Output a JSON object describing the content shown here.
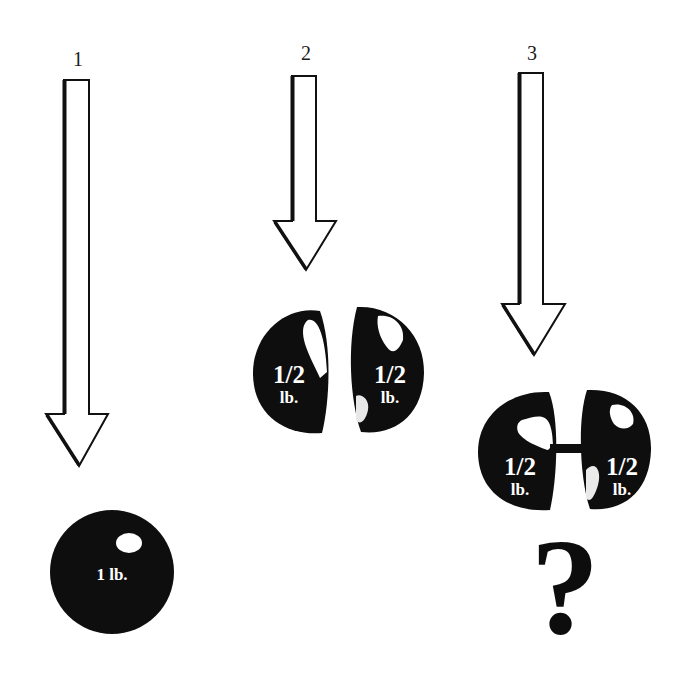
{
  "scenarios": [
    {
      "number": "1",
      "object": "whole-ball",
      "weight_label": "1 lb.",
      "arrow": "long-down-arrow"
    },
    {
      "number": "2",
      "object": "two-separate-halves",
      "halves": [
        {
          "fraction": "1/2",
          "unit": "lb."
        },
        {
          "fraction": "1/2",
          "unit": "lb."
        }
      ],
      "arrow": "short-down-arrow"
    },
    {
      "number": "3",
      "object": "two-connected-halves",
      "halves": [
        {
          "fraction": "1/2",
          "unit": "lb."
        },
        {
          "fraction": "1/2",
          "unit": "lb."
        }
      ],
      "arrow": "medium-down-arrow",
      "question": "?"
    }
  ],
  "colors": {
    "background": "#ffffff",
    "ink": "#111111",
    "highlight": "#ffffff"
  }
}
